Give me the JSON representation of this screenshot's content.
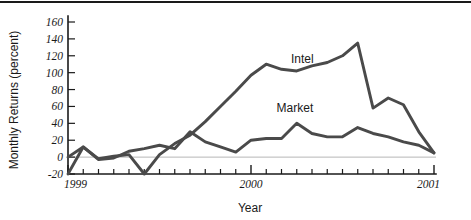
{
  "chart_data": {
    "type": "line",
    "title": "",
    "xlabel": "Year",
    "ylabel": "Monthly Returns (percent)",
    "ylim": [
      -20,
      160
    ],
    "xlim": [
      1999.0,
      2001.0
    ],
    "yticks": [
      -20,
      0,
      20,
      40,
      60,
      80,
      100,
      120,
      140,
      160
    ],
    "ytick_labels": [
      "-20",
      "0",
      "20",
      "40",
      "60",
      "80",
      "100",
      "120",
      "140",
      "160"
    ],
    "xticks": [
      1999,
      2000,
      2001
    ],
    "xtick_labels": [
      "1999",
      "2000",
      "2001"
    ],
    "minor_xtick_interval_months": 1,
    "grid": false,
    "zero_line": true,
    "legend_position": "inline-annotation",
    "line_color": "#4a4a4a",
    "axis_color": "#1a1a1a",
    "zero_line_color": "#b6b6b6",
    "series": [
      {
        "name": "Intel",
        "label_x": 2000.28,
        "label_y": 112,
        "x": [
          1999.0,
          1999.083,
          1999.167,
          1999.25,
          1999.333,
          1999.417,
          1999.5,
          1999.583,
          1999.667,
          1999.75,
          1999.833,
          1999.917,
          2000.0,
          2000.083,
          2000.167,
          2000.25,
          2000.333,
          2000.417,
          2000.5,
          2000.583,
          2000.667,
          2000.75,
          2000.833,
          2000.917,
          2001.0
        ],
        "values": [
          -20,
          12,
          -2,
          1,
          3,
          -20,
          3,
          16,
          26,
          42,
          60,
          78,
          97,
          110,
          104,
          102,
          108,
          112,
          120,
          135,
          58,
          70,
          62,
          30,
          5
        ]
      },
      {
        "name": "Market",
        "label_x": 2000.24,
        "label_y": 53,
        "x": [
          1999.0,
          1999.083,
          1999.167,
          1999.25,
          1999.333,
          1999.417,
          1999.5,
          1999.583,
          1999.667,
          1999.75,
          1999.833,
          1999.917,
          2000.0,
          2000.083,
          2000.167,
          2000.25,
          2000.333,
          2000.417,
          2000.5,
          2000.583,
          2000.667,
          2000.75,
          2000.833,
          2000.917,
          2001.0
        ],
        "values": [
          0,
          12,
          -3,
          -1,
          7,
          10,
          14,
          10,
          30,
          18,
          12,
          6,
          20,
          22,
          22,
          40,
          28,
          24,
          24,
          35,
          28,
          24,
          18,
          14,
          5
        ]
      }
    ]
  },
  "annotations": {
    "intel_label": "Intel",
    "market_label": "Market"
  }
}
